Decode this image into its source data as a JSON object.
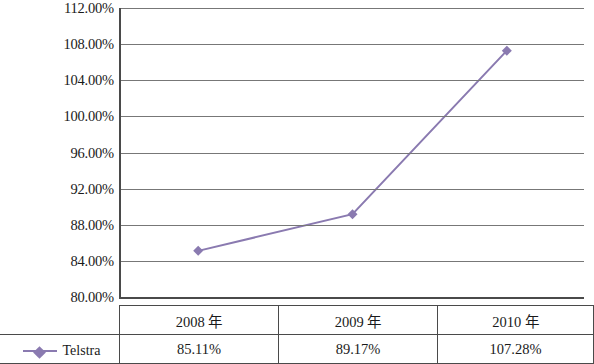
{
  "chart_data": {
    "type": "line",
    "title": "",
    "xlabel": "",
    "ylabel": "",
    "categories": [
      "2008 年",
      "2009 年",
      "2010 年"
    ],
    "series": [
      {
        "name": "Telstra",
        "values": [
          85.11,
          89.17,
          107.28
        ],
        "value_labels": [
          "85.11%",
          "89.17%",
          "107.28%"
        ],
        "color": "#8a7ab0",
        "marker": "diamond"
      }
    ],
    "ylim": [
      80,
      112
    ],
    "ytick_step": 4,
    "yticks": [
      "80.00%",
      "84.00%",
      "88.00%",
      "92.00%",
      "96.00%",
      "100.00%",
      "104.00%",
      "108.00%",
      "112.00%"
    ],
    "grid": true,
    "legend_position": "bottom-left"
  },
  "table": {
    "corner_label": "",
    "legend_label": "Telstra"
  }
}
